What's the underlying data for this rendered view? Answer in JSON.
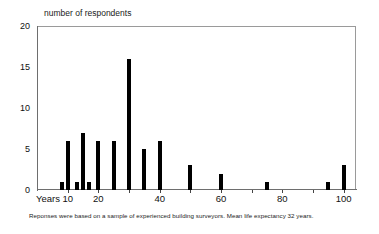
{
  "chart_data": {
    "type": "bar",
    "title": "number of respondents",
    "xlabel": "Years",
    "ylabel": "number of respondents",
    "footnote": "Reponses were based on a sample of experienced building surveyors. Mean life expectancy 32 years.",
    "grid": false,
    "legend": null,
    "xlim": [
      0,
      104
    ],
    "ylim": [
      0,
      20
    ],
    "y_ticks": [
      0,
      5,
      10,
      15,
      20
    ],
    "y_tick_labels": [
      "0",
      "5",
      "10",
      "15",
      "20"
    ],
    "x_ticks": [
      10,
      20,
      30,
      40,
      50,
      60,
      70,
      80,
      90,
      100
    ],
    "x_tick_labels": [
      "10",
      "20",
      "",
      "40",
      "",
      "60",
      "",
      "80",
      "",
      "100"
    ],
    "x_axis_prefix_label": "Years",
    "bar_color": "#000000",
    "categories": [
      8,
      10,
      13,
      15,
      17,
      20,
      25,
      30,
      35,
      40,
      50,
      60,
      75,
      95,
      100
    ],
    "values": [
      1,
      6,
      1,
      7,
      1,
      6,
      6,
      16,
      5,
      6,
      3,
      2,
      1,
      1,
      3
    ],
    "points": [
      {
        "x": 8,
        "y": 1
      },
      {
        "x": 10,
        "y": 6
      },
      {
        "x": 13,
        "y": 1
      },
      {
        "x": 15,
        "y": 7
      },
      {
        "x": 17,
        "y": 1
      },
      {
        "x": 20,
        "y": 6
      },
      {
        "x": 25,
        "y": 6
      },
      {
        "x": 30,
        "y": 16
      },
      {
        "x": 35,
        "y": 5
      },
      {
        "x": 40,
        "y": 6
      },
      {
        "x": 50,
        "y": 3
      },
      {
        "x": 60,
        "y": 2
      },
      {
        "x": 75,
        "y": 1
      },
      {
        "x": 95,
        "y": 1
      },
      {
        "x": 100,
        "y": 3
      }
    ]
  }
}
